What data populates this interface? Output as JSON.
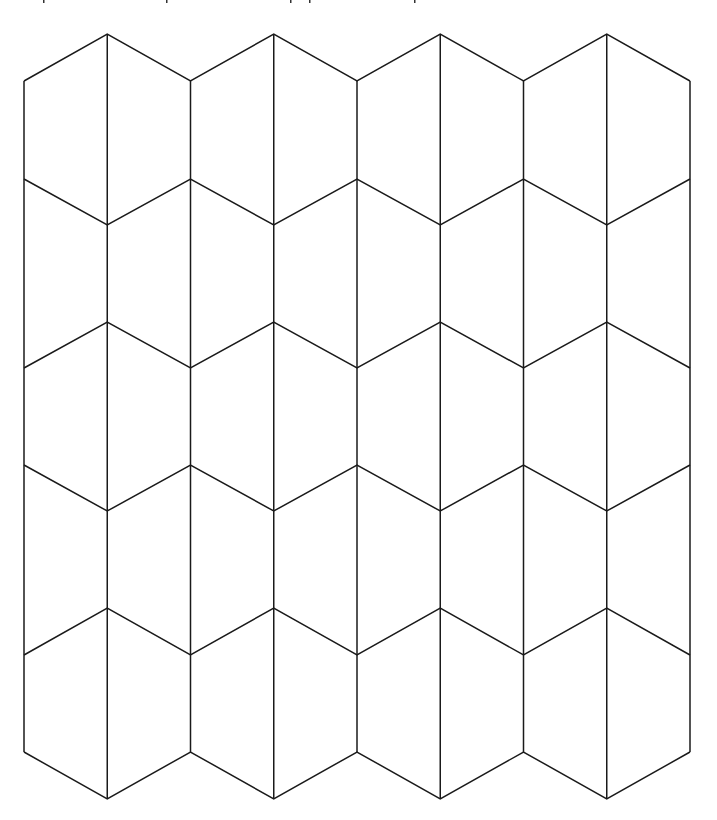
{
  "canvas": {
    "width": 717,
    "height": 820,
    "background": "#ffffff"
  },
  "pattern": {
    "name": "hexagonal tessellation with vertical bisectors (kite/pentagon tiling)",
    "stroke_color": "#1a1a1a",
    "stroke_width": 1.5,
    "columns_x": [
      24,
      107.25,
      190.5,
      273.75,
      357,
      440.25,
      523.5,
      606.75,
      690
    ],
    "zigzag_rows": [
      {
        "even_y": 81,
        "odd_y": 34
      },
      {
        "even_y": 179,
        "odd_y": 225
      },
      {
        "even_y": 368,
        "odd_y": 322
      },
      {
        "even_y": 465,
        "odd_y": 511
      },
      {
        "even_y": 655,
        "odd_y": 608
      },
      {
        "even_y": 752,
        "odd_y": 799
      }
    ],
    "hexagon_columns": 4,
    "hexagon_rows": 5,
    "row_pitch": 143.4
  },
  "top_edge_marks": {
    "color": "#333333",
    "x": [
      43,
      166,
      290,
      309,
      414
    ]
  }
}
